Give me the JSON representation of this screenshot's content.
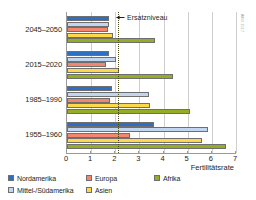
{
  "chart_data": {
    "type": "bar",
    "orientation": "horizontal",
    "title": "",
    "xlabel": "Fertilitätsrate",
    "ylabel": "",
    "xlim": [
      0,
      7
    ],
    "xticks": [
      "0",
      "1",
      "2",
      "3",
      "4",
      "5",
      "6",
      "7"
    ],
    "grid": true,
    "legend_position": "bottom",
    "categories": [
      "2045–2050",
      "2015–2020",
      "1985–1990",
      "1955–1960"
    ],
    "series": [
      {
        "name": "Nordamerika",
        "color": "#2d6fc4",
        "values": [
          1.75,
          1.72,
          1.88,
          3.6
        ]
      },
      {
        "name": "Mittel-/Südamerika",
        "color": "#c3d6f0",
        "values": [
          1.72,
          2.02,
          3.4,
          5.82
        ]
      },
      {
        "name": "Europa",
        "color": "#f2866e",
        "values": [
          1.7,
          1.62,
          1.8,
          2.62
        ]
      },
      {
        "name": "Asien",
        "color": "#fcd94b",
        "values": [
          1.9,
          2.15,
          3.45,
          5.58
        ]
      },
      {
        "name": "Afrika",
        "color": "#93ad25",
        "values": [
          3.65,
          4.4,
          5.1,
          6.6
        ]
      }
    ],
    "annotations": [
      {
        "name": "replacement-level",
        "label": "Ersatzniveau",
        "value": 2.1
      }
    ],
    "source_credit": "AKG 1517"
  },
  "legend": {
    "items": [
      {
        "label": "Nordamerika",
        "color": "#2d6fc4"
      },
      {
        "label": "Europa",
        "color": "#f2866e"
      },
      {
        "label": "Afrika",
        "color": "#93ad25"
      },
      {
        "label": "Mittel-/Südamerika",
        "color": "#c3d6f0"
      },
      {
        "label": "Asien",
        "color": "#fcd94b"
      }
    ]
  },
  "colors": {
    "nordamerika": "#2d6fc4",
    "mittel_suedamerika": "#c3d6f0",
    "europa": "#f2866e",
    "asien": "#fcd94b",
    "afrika": "#93ad25",
    "axis": "#9a9a9a",
    "grid": "#cfcfcf",
    "replacement_line": "#4b4b1e",
    "text": "#231f20"
  }
}
